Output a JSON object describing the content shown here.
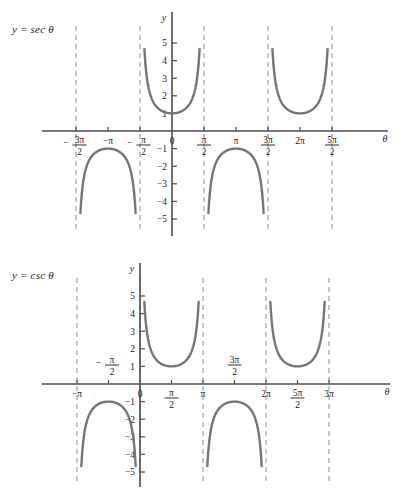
{
  "page": {
    "background_color": "#ffffff",
    "curve_color": "#767676",
    "axis_color": "#4d4d4d",
    "asymptote_color": "#8c8c8c",
    "text_color": "#1a1a1a"
  },
  "figures": [
    {
      "id": "sec",
      "equation_label": "y = sec θ",
      "axis_y_label": "y",
      "axis_x_label": "θ"
    },
    {
      "id": "csc",
      "equation_label": "y = csc θ",
      "axis_y_label": "y",
      "axis_x_label": "θ"
    }
  ],
  "chart_data": [
    {
      "type": "line",
      "title": "y = sec θ",
      "xlabel": "θ",
      "ylabel": "y",
      "grid": false,
      "legend": "none",
      "xlim_units_of_pi_over_2": [
        -3.4,
        2.9
      ],
      "ylim": [
        -5.4,
        5.4
      ],
      "x_tick_labels": [
        {
          "value_pi": -1.5,
          "label": "-3π/2",
          "numerator": "3π",
          "denominator": "2",
          "sign": "−",
          "position": "below"
        },
        {
          "value_pi": -1.0,
          "label": "-π",
          "numerator": "−π",
          "denominator": "",
          "sign": "",
          "position": "below"
        },
        {
          "value_pi": -0.5,
          "label": "-π/2",
          "numerator": "π",
          "denominator": "2",
          "sign": "−",
          "position": "below"
        },
        {
          "value_pi": 0.0,
          "label": "0",
          "numerator": "0",
          "denominator": "",
          "sign": "",
          "position": "below"
        },
        {
          "value_pi": 0.5,
          "label": "π/2",
          "numerator": "π",
          "denominator": "2",
          "sign": "",
          "position": "below"
        },
        {
          "value_pi": 1.0,
          "label": "π",
          "numerator": "π",
          "denominator": "",
          "sign": "",
          "position": "below"
        },
        {
          "value_pi": 1.5,
          "label": "3π/2",
          "numerator": "3π",
          "denominator": "2",
          "sign": "",
          "position": "below"
        },
        {
          "value_pi": 2.0,
          "label": "2π",
          "numerator": "2π",
          "denominator": "",
          "sign": "",
          "position": "below"
        },
        {
          "value_pi": 2.5,
          "label": "5π/2",
          "numerator": "5π",
          "denominator": "2",
          "sign": "",
          "position": "below"
        }
      ],
      "y_tick_labels": [
        "5",
        "4",
        "3",
        "2",
        "1",
        "−1",
        "−2",
        "−3",
        "−4",
        "−5"
      ],
      "y_tick_values": [
        5,
        4,
        3,
        2,
        1,
        -1,
        -2,
        -3,
        -4,
        -5
      ],
      "asymptotes_pi": [
        -1.5,
        -0.5,
        0.5,
        1.5,
        2.5
      ],
      "branches": [
        {
          "center_pi": -1.0,
          "direction": "down",
          "extremum": -1,
          "from_pi": -1.5,
          "to_pi": -0.5
        },
        {
          "center_pi": 0.0,
          "direction": "up",
          "extremum": 1,
          "from_pi": -0.5,
          "to_pi": 0.5
        },
        {
          "center_pi": 1.0,
          "direction": "down",
          "extremum": -1,
          "from_pi": 0.5,
          "to_pi": 1.5
        },
        {
          "center_pi": 2.0,
          "direction": "up",
          "extremum": 1,
          "from_pi": 1.5,
          "to_pi": 2.5
        }
      ]
    },
    {
      "type": "line",
      "title": "y = csc θ",
      "xlabel": "θ",
      "ylabel": "y",
      "grid": false,
      "legend": "none",
      "xlim_units_of_pi_over_2": [
        -2.4,
        6.4
      ],
      "ylim": [
        -5.4,
        5.4
      ],
      "x_tick_labels": [
        {
          "value_pi": -1.0,
          "label": "-π",
          "numerator": "−π",
          "denominator": "",
          "sign": "",
          "position": "below"
        },
        {
          "value_pi": -0.5,
          "label": "-π/2",
          "numerator": "π",
          "denominator": "2",
          "sign": "−",
          "position": "above"
        },
        {
          "value_pi": 0.0,
          "label": "0",
          "numerator": "0",
          "denominator": "",
          "sign": "",
          "position": "below"
        },
        {
          "value_pi": 0.5,
          "label": "π/2",
          "numerator": "π",
          "denominator": "2",
          "sign": "",
          "position": "below"
        },
        {
          "value_pi": 1.0,
          "label": "π",
          "numerator": "π",
          "denominator": "",
          "sign": "",
          "position": "below"
        },
        {
          "value_pi": 1.5,
          "label": "3π/2",
          "numerator": "3π",
          "denominator": "2",
          "sign": "",
          "position": "above"
        },
        {
          "value_pi": 2.0,
          "label": "2π",
          "numerator": "2π",
          "denominator": "",
          "sign": "",
          "position": "below"
        },
        {
          "value_pi": 2.5,
          "label": "5π/2",
          "numerator": "5π",
          "denominator": "2",
          "sign": "",
          "position": "below"
        },
        {
          "value_pi": 3.0,
          "label": "3π",
          "numerator": "3π",
          "denominator": "",
          "sign": "",
          "position": "below"
        }
      ],
      "y_tick_labels": [
        "5",
        "4",
        "3",
        "2",
        "1",
        "−1",
        "−2",
        "−3",
        "−4",
        "−5"
      ],
      "y_tick_values": [
        5,
        4,
        3,
        2,
        1,
        -1,
        -2,
        -3,
        -4,
        -5
      ],
      "asymptotes_pi": [
        -1.0,
        0.0,
        1.0,
        2.0,
        3.0
      ],
      "branches": [
        {
          "center_pi": -0.5,
          "direction": "down",
          "extremum": -1,
          "from_pi": -1.0,
          "to_pi": 0.0
        },
        {
          "center_pi": 0.5,
          "direction": "up",
          "extremum": 1,
          "from_pi": 0.0,
          "to_pi": 1.0
        },
        {
          "center_pi": 1.5,
          "direction": "down",
          "extremum": -1,
          "from_pi": 1.0,
          "to_pi": 2.0
        },
        {
          "center_pi": 2.5,
          "direction": "up",
          "extremum": 1,
          "from_pi": 2.0,
          "to_pi": 3.0
        }
      ]
    }
  ]
}
